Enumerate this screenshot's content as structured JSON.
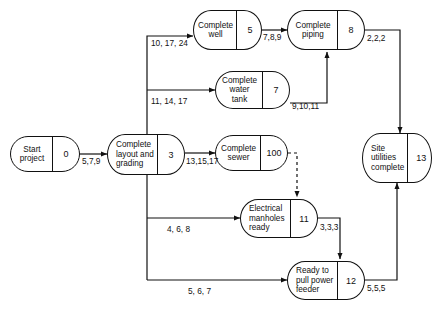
{
  "diagram": {
    "stroke_color": "#111111",
    "background": "#ffffff",
    "nodes": [
      {
        "id": "start-project",
        "lines": [
          "Start",
          "project"
        ],
        "number": "0"
      },
      {
        "id": "complete-layout",
        "lines": [
          "Complete",
          "layout and",
          "grading"
        ],
        "number": "3"
      },
      {
        "id": "complete-well",
        "lines": [
          "Complete",
          "well"
        ],
        "number": "5"
      },
      {
        "id": "complete-water-tank",
        "lines": [
          "Complete",
          "water",
          "tank"
        ],
        "number": "7"
      },
      {
        "id": "complete-piping",
        "lines": [
          "Complete",
          "piping"
        ],
        "number": "8"
      },
      {
        "id": "complete-sewer",
        "lines": [
          "Complete",
          "sewer"
        ],
        "number": "100"
      },
      {
        "id": "electrical-manholes",
        "lines": [
          "Electrical",
          "manholes",
          "ready"
        ],
        "number": "11"
      },
      {
        "id": "ready-pull-power",
        "lines": [
          "Ready to",
          "pull power",
          "feeder"
        ],
        "number": "12"
      },
      {
        "id": "site-utilities",
        "lines": [
          "Site",
          "utilities",
          "complete"
        ],
        "number": "13"
      }
    ],
    "edge_labels": [
      {
        "id": "edge-start-to-layout",
        "text": "5,7,9"
      },
      {
        "id": "edge-layout-to-well",
        "text": "10, 17, 24"
      },
      {
        "id": "edge-layout-to-water-tank",
        "text": "11, 14, 17"
      },
      {
        "id": "edge-layout-to-sewer",
        "text": "13,15,17"
      },
      {
        "id": "edge-layout-to-manholes",
        "text": "4, 6, 8"
      },
      {
        "id": "edge-layout-to-power-feeder",
        "text": "5, 6, 7"
      },
      {
        "id": "edge-well-to-piping",
        "text": "7,8,9"
      },
      {
        "id": "edge-water-tank-to-piping",
        "text": "9,10,11"
      },
      {
        "id": "edge-piping-to-site",
        "text": "2,2,2"
      },
      {
        "id": "edge-manholes-to-power-feeder",
        "text": "3,3,3"
      },
      {
        "id": "edge-power-feeder-to-site",
        "text": "5,5,5"
      }
    ]
  }
}
